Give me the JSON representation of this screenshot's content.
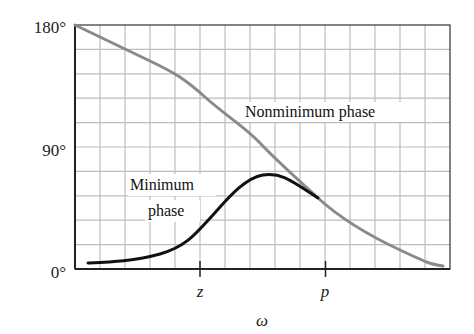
{
  "chart_data": {
    "type": "line",
    "title": "",
    "xlabel": "ω",
    "ylabel": "",
    "y_ticks": [
      "0°",
      "90°",
      "180°"
    ],
    "ylim": [
      0,
      180
    ],
    "x_ticks": [
      "z",
      "p"
    ],
    "x_scale": "log (unlabeled)",
    "grid": true,
    "x": [
      0.0,
      0.035,
      0.13,
      0.27,
      0.347,
      0.413,
      0.501,
      0.547,
      0.6,
      0.65,
      0.733,
      0.867,
      0.981
    ],
    "series": [
      {
        "name": "Nonminimum phase",
        "color": "#8a8a8a",
        "values": [
          180,
          177,
          162,
          146,
          138,
          124,
          114,
          95,
          78,
          60,
          42,
          20,
          2
        ]
      },
      {
        "name": "Minimum phase",
        "color": "#111111",
        "values": [
          null,
          4,
          6,
          18,
          35,
          51,
          69,
          67,
          60,
          52,
          35,
          14,
          2
        ]
      }
    ],
    "annotations": [
      {
        "text": "Nonminimum phase",
        "near": "upper right of gray curve"
      },
      {
        "text": "Minimum phase",
        "near": "left of black curve peak"
      }
    ],
    "legend_position": "none (inline labels)"
  },
  "labels": {
    "y180": "180°",
    "y90": "90°",
    "y0": "0°",
    "tick_z": "z",
    "tick_p": "p",
    "xaxis": "ω",
    "nonmin_label": "Nonminimum phase",
    "min_label_line1": "Minimum",
    "min_label_line2": "phase"
  },
  "colors": {
    "grid": "#bdbdbd",
    "axis": "#222222",
    "nonminimum_curve": "#8a8a8a",
    "minimum_curve": "#111111"
  }
}
